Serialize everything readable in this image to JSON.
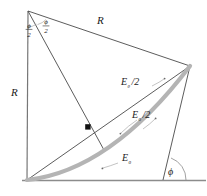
{
  "figure": {
    "colors": {
      "stroke": "#3a3a3a",
      "arc": "#b0b0b0",
      "baseline": "#8c8c8c",
      "dot": "#111111",
      "leader": "#888888",
      "text": "#1a1a1a"
    },
    "labels": {
      "radius_left": "R",
      "radius_top": "R",
      "angle_half_left": "ϕ",
      "angle_half_left_den": "2",
      "angle_half_right": "ϕ",
      "angle_half_right_den": "2",
      "e_theta_half": "E",
      "e_theta_half_sub": "θ",
      "e_theta_half_div": "/2",
      "e_zero_half": "E",
      "e_zero_half_sub": "0",
      "e_zero_half_div": "/2",
      "e_zero": "E",
      "e_zero_sub": "0",
      "phi": "ϕ"
    },
    "geometry": {
      "apex": [
        28,
        11
      ],
      "bottom_left": [
        27,
        180
      ],
      "right_vertex": [
        190,
        66
      ],
      "chord_midpoint": [
        88,
        127
      ],
      "baseline_end": [
        205,
        180
      ],
      "phi_foot": [
        163,
        180
      ]
    }
  }
}
